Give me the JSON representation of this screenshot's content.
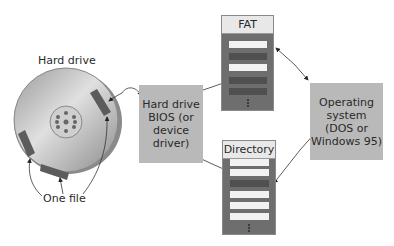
{
  "labels": {
    "hard_drive": "Hard drive",
    "one_file": "One file"
  },
  "boxes": {
    "bios": {
      "line1": "Hard drive",
      "line2": "BIOS (or",
      "line3": "device",
      "line4": "driver)"
    },
    "os": {
      "line1": "Operating",
      "line2": "system",
      "line3": "(DOS or",
      "line4": "Windows 95)"
    }
  },
  "tables": {
    "fat": {
      "title": "FAT",
      "rows": [
        "light",
        "dark",
        "light",
        "dark",
        "dark"
      ]
    },
    "directory": {
      "title": "Directory",
      "rows": [
        "light",
        "light",
        "dark",
        "light",
        "light",
        "light"
      ]
    }
  },
  "colors": {
    "box_gray": "#b9b9b9",
    "table_bg": "#6e6e6e",
    "row_light": "#f2f2f2",
    "row_dark": "#505050",
    "file_segment": "#5c5c5c"
  }
}
